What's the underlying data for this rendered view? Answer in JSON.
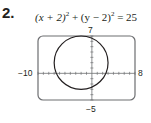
{
  "problem": {
    "number": "2.",
    "equation_parts": [
      "(x + 2)",
      "2",
      " + (y − 2)",
      "2",
      " = 25"
    ]
  },
  "chart_data": {
    "type": "line",
    "shape": "circle",
    "center": [
      -2,
      2
    ],
    "radius": 5,
    "xlim": [
      -10,
      8
    ],
    "ylim": [
      -5,
      7
    ],
    "window_labels": {
      "xmin": "−10",
      "xmax": "8",
      "ymin": "−5",
      "ymax": "7"
    },
    "x_ticks_step": 1,
    "y_ticks_step": 1,
    "grid": false,
    "legend": null
  }
}
